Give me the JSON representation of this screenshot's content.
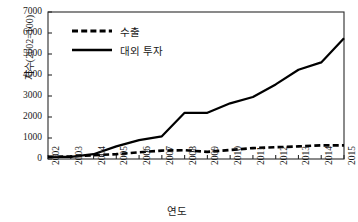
{
  "chart_data": {
    "type": "line",
    "title": "",
    "xlabel": "연도",
    "ylabel": "지수(2002=100)",
    "x": [
      2002,
      2003,
      2004,
      2005,
      2006,
      2007,
      2008,
      2009,
      2010,
      2011,
      2012,
      2013,
      2014,
      2015
    ],
    "xtick_labels": [
      "2002",
      "2003",
      "2004",
      "2005",
      "2006",
      "2007",
      "2008",
      "2009",
      "2010",
      "2011",
      "2012",
      "2013",
      "2014",
      "2015"
    ],
    "ytick_labels": [
      "0",
      "1000",
      "2000",
      "3000",
      "4000",
      "5000",
      "6000",
      "7000"
    ],
    "ytick_values": [
      0,
      1000,
      2000,
      3000,
      4000,
      5000,
      6000,
      7000
    ],
    "ylim": [
      0,
      7000
    ],
    "xlim": [
      2002,
      2015
    ],
    "grid": false,
    "legend_position": "upper left (inside axes)",
    "series": [
      {
        "name": "수출",
        "style": "dashed",
        "color": "#000000",
        "values": [
          100,
          120,
          180,
          230,
          320,
          400,
          420,
          340,
          430,
          520,
          560,
          600,
          650,
          650
        ]
      },
      {
        "name": "대외 투자",
        "style": "solid",
        "color": "#000000",
        "values": [
          100,
          100,
          230,
          600,
          900,
          1080,
          2200,
          2200,
          2650,
          2950,
          3550,
          4250,
          4600,
          5750
        ]
      }
    ]
  },
  "legend": {
    "items": [
      {
        "label": "수출",
        "style": "dashed"
      },
      {
        "label": "대외 투자",
        "style": "solid"
      }
    ]
  }
}
